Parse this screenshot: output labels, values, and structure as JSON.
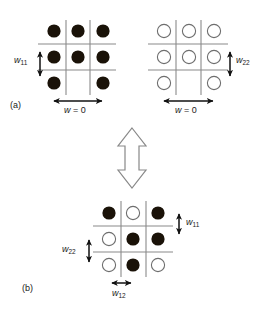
{
  "figure": {
    "type": "schematic-diagram",
    "background_color": "#ffffff",
    "panels": [
      {
        "tag": "(a)",
        "tag_position": {
          "x": 10,
          "y": 100
        },
        "description": "two separate sublattices",
        "grids": [
          {
            "name": "grid-a-left",
            "fill_style": "filled",
            "cells": [
              [
                "filled",
                "filled",
                "filled"
              ],
              [
                "filled",
                "filled",
                "filled"
              ],
              [
                "filled",
                "empty",
                "filled"
              ]
            ],
            "labels": {
              "vertical": "w11",
              "horizontal": "w = 0"
            }
          },
          {
            "name": "grid-a-right",
            "fill_style": "open",
            "cells": [
              [
                "open",
                "open",
                "open"
              ],
              [
                "open",
                "open",
                "open"
              ],
              [
                "open",
                "empty",
                "open"
              ]
            ],
            "labels": {
              "vertical": "w22",
              "horizontal": "w = 0"
            }
          }
        ]
      },
      {
        "tag": "(b)",
        "tag_position": {
          "x": 22,
          "y": 288
        },
        "description": "combined interpenetrating lattice",
        "grids": [
          {
            "name": "grid-b",
            "fill_style": "mixed",
            "cells": [
              [
                "filled",
                "open",
                "filled"
              ],
              [
                "open",
                "filled",
                "filled"
              ],
              [
                "open",
                "filled",
                "open"
              ]
            ],
            "labels": {
              "right_vertical": "w11",
              "left_vertical": "w22",
              "bottom_horizontal": "w12"
            }
          }
        ]
      }
    ],
    "connector": {
      "name": "vertical-double-arrow",
      "style": "hollow-block-arrow",
      "direction": "bidirectional-vertical"
    },
    "labels": {
      "w11": {
        "base": "w",
        "sub": "11"
      },
      "w22": {
        "base": "w",
        "sub": "22"
      },
      "w12": {
        "base": "w",
        "sub": "12"
      },
      "w_zero": {
        "base": "w",
        "equals": " = 0"
      }
    },
    "colors": {
      "filled_circle": "#1a1208",
      "open_circle_stroke": "#6e6e6e",
      "open_circle_fill": "#ffffff",
      "grid_line": "#8a8a8a",
      "arrow": "#111111",
      "hollow_arrow_stroke": "#888888",
      "text": "#1a1a1a"
    }
  }
}
